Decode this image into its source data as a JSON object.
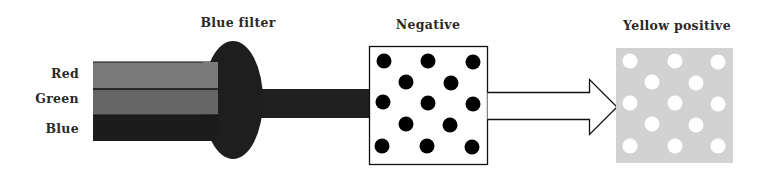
{
  "diagram": {
    "band_labels": [
      "Red",
      "Green",
      "Blue"
    ],
    "filter_label": "Blue filter",
    "negative_label": "Negative",
    "positive_label": "Yellow positive"
  },
  "colors": {
    "red_band": "#7a7a7a",
    "green_band": "#666666",
    "blue_band": "#1c1c1c",
    "filter": "#1e1e1e",
    "beam": "#202020",
    "negative_dots": "#000000",
    "positive_bg": "#d2d2d2",
    "positive_dots": "#ffffff"
  }
}
